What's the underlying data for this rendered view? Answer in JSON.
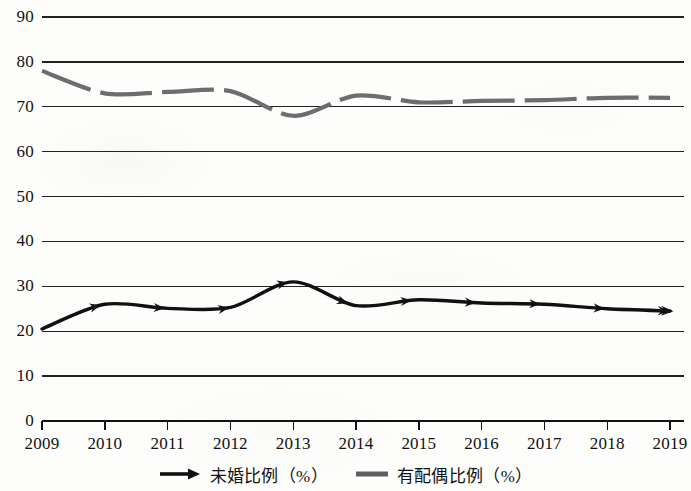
{
  "chart_data": {
    "type": "line",
    "title": "",
    "subtitle": "",
    "xlabel": "",
    "ylabel": "",
    "categories": [
      "2009",
      "2010",
      "2011",
      "2012",
      "2013",
      "2014",
      "2015",
      "2016",
      "2017",
      "2018",
      "2019"
    ],
    "ylim": [
      0,
      90
    ],
    "ytick_step": 10,
    "yticks": [
      "0",
      "10",
      "20",
      "30",
      "40",
      "50",
      "60",
      "70",
      "80",
      "90"
    ],
    "grid": true,
    "grid_axis": "y",
    "legend_position": "bottom-center",
    "series": [
      {
        "name": "未婚比例（%）",
        "color": "#111111",
        "style": "solid",
        "marker": "arrow",
        "values": [
          20.5,
          26.0,
          25.1,
          25.3,
          31.0,
          25.7,
          27.0,
          26.3,
          26.0,
          25.0,
          24.5
        ]
      },
      {
        "name": "有配偶比例（%）",
        "color": "#6d6d6d",
        "style": "dashed",
        "marker": "none",
        "values": [
          78.0,
          73.0,
          73.3,
          73.5,
          68.0,
          72.5,
          71.0,
          71.3,
          71.5,
          72.0,
          72.0
        ]
      }
    ],
    "annotations": []
  },
  "legend": {
    "items": [
      {
        "label": "未婚比例（%）",
        "swatch": "arrow-line-black"
      },
      {
        "label": "有配偶比例（%）",
        "swatch": "thick-dash-gray"
      }
    ]
  },
  "colors": {
    "background": "#fdfdfb",
    "axis": "#111111",
    "grid": "#222222",
    "series_unmarried": "#111111",
    "series_married": "#6d6d6d"
  }
}
